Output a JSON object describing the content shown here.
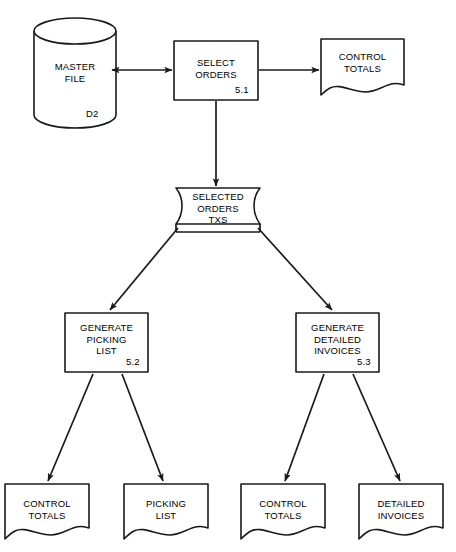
{
  "diagram": {
    "type": "data-flow-diagram",
    "title": "",
    "background_color": "#ffffff",
    "line_color": "#1a1a1a",
    "nodes": [
      {
        "id": "master-file",
        "shape": "cylinder-data-store",
        "label": "MASTER\nFILE",
        "corner_id": "D2",
        "x": 34,
        "y": 18,
        "w": 82,
        "h": 110
      },
      {
        "id": "select-orders",
        "shape": "process-box",
        "label": "SELECT\nORDERS",
        "corner_id": "5.1",
        "x": 174,
        "y": 41,
        "w": 84,
        "h": 59
      },
      {
        "id": "control-totals-top",
        "shape": "document",
        "label": "CONTROL\nTOTALS",
        "corner_id": "",
        "x": 321,
        "y": 39,
        "w": 83,
        "h": 58
      },
      {
        "id": "selected-orders-txs",
        "shape": "transaction-file",
        "label": "SELECTED\nORDERS\nTXS",
        "corner_id": "",
        "x": 176,
        "y": 188,
        "w": 84,
        "h": 44
      },
      {
        "id": "generate-picking-list",
        "shape": "process-box",
        "label": "GENERATE\nPICKING\nLIST",
        "corner_id": "5.2",
        "x": 65,
        "y": 313,
        "w": 83,
        "h": 59
      },
      {
        "id": "generate-detailed-invoices",
        "shape": "process-box",
        "label": "GENERATE\nDETAILED\nINVOICES",
        "corner_id": "5.3",
        "x": 296,
        "y": 313,
        "w": 83,
        "h": 59
      },
      {
        "id": "control-totals-left",
        "shape": "document",
        "label": "CONTROL\nTOTALS",
        "corner_id": "",
        "x": 5,
        "y": 484,
        "w": 84,
        "h": 56
      },
      {
        "id": "picking-list",
        "shape": "document",
        "label": "PICKING\nLIST",
        "corner_id": "",
        "x": 124,
        "y": 484,
        "w": 84,
        "h": 56
      },
      {
        "id": "control-totals-right",
        "shape": "document",
        "label": "CONTROL\nTOTALS",
        "corner_id": "",
        "x": 241,
        "y": 484,
        "w": 84,
        "h": 56
      },
      {
        "id": "detailed-invoices",
        "shape": "document",
        "label": "DETAILED\nINVOICES",
        "corner_id": "",
        "x": 359,
        "y": 484,
        "w": 84,
        "h": 56
      }
    ],
    "edges": [
      {
        "id": "master-file-to-select-orders",
        "from": "master-file",
        "to": "select-orders",
        "arrowheads": "both"
      },
      {
        "id": "select-orders-to-control-totals",
        "from": "select-orders",
        "to": "control-totals-top",
        "arrowheads": "end"
      },
      {
        "id": "select-orders-to-selected-orders-txs",
        "from": "select-orders",
        "to": "selected-orders-txs",
        "arrowheads": "end"
      },
      {
        "id": "txs-to-generate-picking-list",
        "from": "selected-orders-txs",
        "to": "generate-picking-list",
        "arrowheads": "end"
      },
      {
        "id": "txs-to-generate-detailed-invoices",
        "from": "selected-orders-txs",
        "to": "generate-detailed-invoices",
        "arrowheads": "end"
      },
      {
        "id": "picking-to-control-totals-left",
        "from": "generate-picking-list",
        "to": "control-totals-left",
        "arrowheads": "end"
      },
      {
        "id": "picking-to-picking-list",
        "from": "generate-picking-list",
        "to": "picking-list",
        "arrowheads": "end"
      },
      {
        "id": "invoices-to-control-totals-right",
        "from": "generate-detailed-invoices",
        "to": "control-totals-right",
        "arrowheads": "end"
      },
      {
        "id": "invoices-to-detailed-invoices",
        "from": "generate-detailed-invoices",
        "to": "detailed-invoices",
        "arrowheads": "end"
      }
    ]
  }
}
